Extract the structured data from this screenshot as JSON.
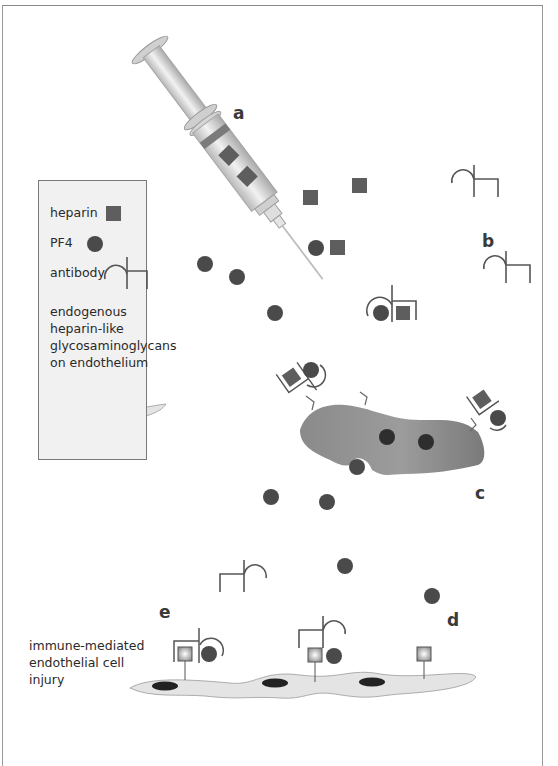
{
  "figure": {
    "panel_labels": {
      "a": "a",
      "b": "b",
      "c": "c",
      "d": "d",
      "e": "e"
    }
  },
  "legend": {
    "items": [
      {
        "label": "heparin",
        "symbol": "square",
        "color": "#5e5e5e"
      },
      {
        "label": "PF4",
        "symbol": "circle",
        "color": "#4a4a4a"
      },
      {
        "label": "antibody",
        "symbol": "antibody-glyph",
        "color": "#555555"
      }
    ],
    "endothelium_label_lines": [
      "endogenous",
      "heparin-like",
      "glycosaminoglycans",
      "on endothelium"
    ]
  },
  "caption": {
    "lines": [
      "immune-mediated",
      "endothelial cell",
      "injury"
    ]
  },
  "colors": {
    "heparin": "#5e5e5e",
    "pf4": "#4a4a4a",
    "antibody_stroke": "#555555",
    "platelet": "#7b7b7b",
    "endothelium": "#e4e4e4",
    "nucleus": "#222222",
    "legend_bg": "#f1f1f1",
    "syringe": "#d9d9d9"
  }
}
